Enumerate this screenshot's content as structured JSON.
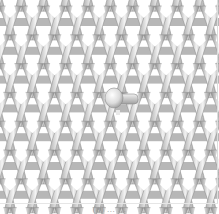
{
  "figure": {
    "wales": 10,
    "courses": 8,
    "wale_spacing_px": 22.3,
    "course_spacing_px": 28.8,
    "colors": {
      "background": "#ffffff",
      "yarn_light": "#f4f4f4",
      "yarn_mid": "#c8c8c8",
      "yarn_dark": "#8a8a8a",
      "shadow": "#7c7c7c"
    },
    "defect": {
      "label": "tuck / float defect",
      "cx": 114,
      "cy": 98
    },
    "caption": "(a) ... ..."
  }
}
